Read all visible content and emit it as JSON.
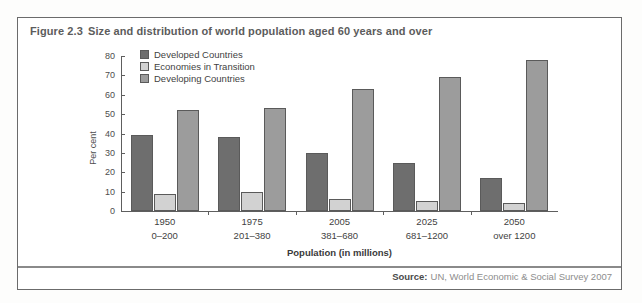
{
  "figure": {
    "number": "Figure 2.3",
    "title": "Size and distribution of world population aged 60 years and over"
  },
  "source": {
    "label": "Source:",
    "text": "UN, World Economic & Social Survey 2007"
  },
  "chart_data": {
    "type": "bar",
    "title": "Size and distribution of world population aged 60 years and over",
    "xlabel": "Population (in millions)",
    "ylabel": "Per cent",
    "ylim": [
      0,
      80
    ],
    "yticks": [
      0,
      10,
      20,
      30,
      40,
      50,
      60,
      70,
      80
    ],
    "grid": false,
    "legend_position": "top-left",
    "categories": [
      "1950",
      "1975",
      "2005",
      "2025",
      "2050"
    ],
    "category_sublabels": [
      "0–200",
      "201–380",
      "381–680",
      "681–1200",
      "over 1200"
    ],
    "series": [
      {
        "name": "Developed Countries",
        "color": "#6e6e6e",
        "values": [
          39,
          38,
          30,
          25,
          17
        ]
      },
      {
        "name": "Economies in Transition",
        "color": "#d2d2d2",
        "values": [
          9,
          10,
          6,
          5,
          4
        ]
      },
      {
        "name": "Developing Countries",
        "color": "#9c9c9c",
        "values": [
          52,
          53,
          63,
          69,
          78
        ]
      }
    ]
  }
}
